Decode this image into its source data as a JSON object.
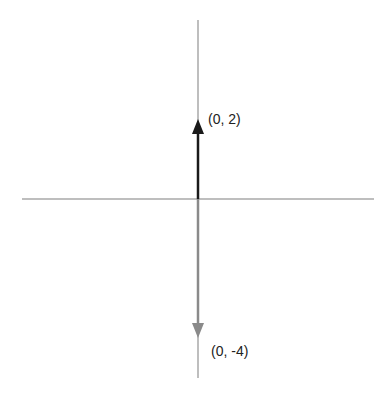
{
  "diagram": {
    "type": "vector-diagram",
    "axes": {
      "x_axis": {
        "color": "#a8a8a8",
        "from": [
          22,
          199
        ],
        "to": [
          374,
          199
        ]
      },
      "y_axis": {
        "color": "#a8a8a8",
        "from": [
          198,
          20
        ],
        "to": [
          198,
          378
        ]
      }
    },
    "vectors": [
      {
        "name": "vector-up",
        "label": "(0, 2)",
        "components": [
          0,
          2
        ],
        "color": "#1a1a1a",
        "tail": [
          198,
          199
        ],
        "tip": [
          198,
          119
        ]
      },
      {
        "name": "vector-down",
        "label": "(0, -4)",
        "components": [
          0,
          -4
        ],
        "color": "#8a8a8a",
        "tail": [
          198,
          199
        ],
        "tip": [
          198,
          338
        ]
      }
    ]
  }
}
